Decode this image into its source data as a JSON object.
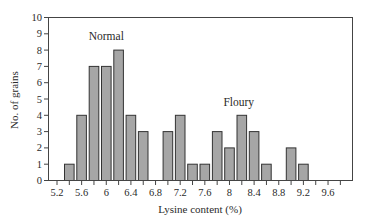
{
  "chart_data": {
    "type": "bar",
    "title": "",
    "xlabel": "Lysine content (%)",
    "ylabel": "No. of grains",
    "ylim": [
      0,
      10
    ],
    "xlim": [
      5.2,
      9.8
    ],
    "grid": false,
    "legend": null,
    "y_ticks": [
      0,
      1,
      2,
      3,
      4,
      5,
      6,
      7,
      8,
      9,
      10
    ],
    "x_tick_labels": [
      "5.2",
      "5.6",
      "6",
      "6.4",
      "6.8",
      "7.2",
      "7.6",
      "8",
      "8.4",
      "8.8",
      "9.2",
      "9.6"
    ],
    "x_minor_step": 0.2,
    "categories": [
      5.4,
      5.6,
      5.8,
      6.0,
      6.2,
      6.4,
      6.6,
      6.8,
      7.0,
      7.2,
      7.4,
      7.6,
      7.8,
      8.0,
      8.2,
      8.4,
      8.6,
      8.8,
      9.0,
      9.2
    ],
    "values": [
      1,
      4,
      7,
      7,
      8,
      4,
      3,
      0,
      3,
      4,
      1,
      1,
      3,
      2,
      4,
      3,
      1,
      0,
      2,
      1
    ],
    "annotations": [
      {
        "text": "Normal",
        "x": 6.0,
        "y": 8.6
      },
      {
        "text": "Floury",
        "x": 8.15,
        "y": 4.6
      }
    ],
    "colors": {
      "bar_fill": "#a6a6a6",
      "bar_edge": "#333333",
      "frame": "#444444"
    }
  }
}
